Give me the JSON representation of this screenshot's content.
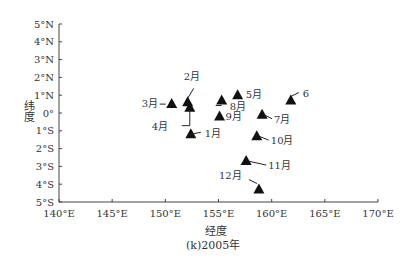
{
  "chart_data": {
    "type": "scatter",
    "title": "(k)2005年",
    "xlabel": "经度",
    "ylabel": "纬度",
    "xlim": [
      140,
      170
    ],
    "ylim": [
      -5,
      5
    ],
    "x_ticks": [
      "140°E",
      "145°E",
      "150°E",
      "155°E",
      "160°E",
      "165°E",
      "170°E"
    ],
    "y_ticks": [
      "5°N",
      "4°N",
      "3°N",
      "2°N",
      "1°N",
      "0°",
      "1°S",
      "2°S",
      "3°S",
      "4°S",
      "5°S"
    ],
    "grid": false,
    "marker": "triangle",
    "marker_color": "#111111",
    "points": [
      {
        "label": "1月",
        "lon": 152.4,
        "lat": -1.2
      },
      {
        "label": "2月",
        "lon": 152.1,
        "lat": 0.6
      },
      {
        "label": "3月",
        "lon": 150.6,
        "lat": 0.5
      },
      {
        "label": "4月",
        "lon": 152.3,
        "lat": 0.3
      },
      {
        "label": "5月",
        "lon": 156.8,
        "lat": 1.0
      },
      {
        "label": "6",
        "lon": 161.8,
        "lat": 0.7
      },
      {
        "label": "7月",
        "lon": 159.1,
        "lat": -0.1
      },
      {
        "label": "8月",
        "lon": 155.3,
        "lat": 0.7
      },
      {
        "label": "9月",
        "lon": 155.1,
        "lat": -0.2
      },
      {
        "label": "10月",
        "lon": 158.6,
        "lat": -1.3
      },
      {
        "label": "11月",
        "lon": 157.6,
        "lat": -2.7
      },
      {
        "label": "12月",
        "lon": 158.8,
        "lat": -4.3
      }
    ]
  }
}
